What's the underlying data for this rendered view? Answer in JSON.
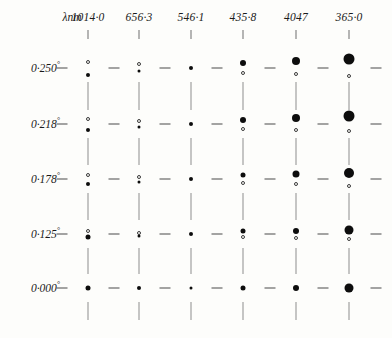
{
  "figure": {
    "axis_label": "λnm",
    "axis_label_x": 72,
    "axis_label_y": 18,
    "header_y": 18,
    "tick_y": 30,
    "tick_h": 9,
    "width": 392,
    "height": 338,
    "ink_color": "#0d0d0d",
    "grid_color": "#8d8d8d",
    "dash_color": "#4a4a4a",
    "paper_color": "#fdfdfb"
  },
  "chart_data": {
    "type": "scatter",
    "title": "",
    "subtitle": "",
    "xlabel": "λnm",
    "ylabel": "",
    "grid": true,
    "legend": "none",
    "x": [
      1014.0,
      656.3,
      546.1,
      435.8,
      404.7,
      365.0
    ],
    "x_tick_labels": [
      "1014·0",
      "656·3",
      "546·1",
      "435·8",
      "4047",
      "365·0"
    ],
    "x_pixels": [
      88,
      139,
      191,
      243,
      296,
      349
    ],
    "y_tick_labels": [
      "0·250",
      "0·218",
      "0·178",
      "0·125",
      "0·000"
    ],
    "y_unit": "°",
    "y": [
      0.25,
      0.218,
      0.178,
      0.125,
      0.0
    ],
    "y_pixels": [
      68,
      124,
      179,
      234,
      288
    ],
    "row_label_x": 60,
    "dash_positions_x": [
      62,
      114,
      165,
      217,
      270,
      323,
      376
    ],
    "dash_width": 11,
    "series": [
      {
        "name": "0·250°",
        "angle": 0.25,
        "row_index": 0,
        "points": [
          {
            "wavelength": 1014.0,
            "upper": {
              "style": "open",
              "size": 4,
              "offset": -6
            },
            "lower": {
              "style": "filled",
              "size": 4,
              "offset": 7
            }
          },
          {
            "wavelength": 656.3,
            "upper": {
              "style": "open",
              "size": 4,
              "offset": -4
            },
            "lower": {
              "style": "filled",
              "size": 3,
              "offset": 3
            }
          },
          {
            "wavelength": 546.1,
            "upper": {
              "style": "filled",
              "size": 4,
              "offset": 0
            },
            "lower": null
          },
          {
            "wavelength": 435.8,
            "upper": {
              "style": "filled",
              "size": 6,
              "offset": -5
            },
            "lower": {
              "style": "open",
              "size": 4,
              "offset": 5
            }
          },
          {
            "wavelength": 404.7,
            "upper": {
              "style": "filled",
              "size": 8,
              "offset": -7
            },
            "lower": {
              "style": "open",
              "size": 4,
              "offset": 6
            }
          },
          {
            "wavelength": 365.0,
            "upper": {
              "style": "filled",
              "size": 11,
              "offset": -9
            },
            "lower": {
              "style": "open",
              "size": 4,
              "offset": 8
            }
          }
        ]
      },
      {
        "name": "0·218°",
        "angle": 0.218,
        "row_index": 1,
        "points": [
          {
            "wavelength": 1014.0,
            "upper": {
              "style": "open",
              "size": 4,
              "offset": -5
            },
            "lower": {
              "style": "filled",
              "size": 4,
              "offset": 6
            }
          },
          {
            "wavelength": 656.3,
            "upper": {
              "style": "open",
              "size": 4,
              "offset": -3
            },
            "lower": {
              "style": "filled",
              "size": 3,
              "offset": 3
            }
          },
          {
            "wavelength": 546.1,
            "upper": {
              "style": "filled",
              "size": 4,
              "offset": 0
            },
            "lower": null
          },
          {
            "wavelength": 435.8,
            "upper": {
              "style": "filled",
              "size": 6,
              "offset": -4
            },
            "lower": {
              "style": "open",
              "size": 4,
              "offset": 5
            }
          },
          {
            "wavelength": 404.7,
            "upper": {
              "style": "filled",
              "size": 8,
              "offset": -6
            },
            "lower": {
              "style": "open",
              "size": 4,
              "offset": 6
            }
          },
          {
            "wavelength": 365.0,
            "upper": {
              "style": "filled",
              "size": 11,
              "offset": -8
            },
            "lower": {
              "style": "open",
              "size": 4,
              "offset": 7
            }
          }
        ]
      },
      {
        "name": "0·178°",
        "angle": 0.178,
        "row_index": 2,
        "points": [
          {
            "wavelength": 1014.0,
            "upper": {
              "style": "open",
              "size": 4,
              "offset": -4
            },
            "lower": {
              "style": "filled",
              "size": 4,
              "offset": 5
            }
          },
          {
            "wavelength": 656.3,
            "upper": {
              "style": "open",
              "size": 4,
              "offset": -2
            },
            "lower": {
              "style": "filled",
              "size": 3,
              "offset": 3
            }
          },
          {
            "wavelength": 546.1,
            "upper": {
              "style": "filled",
              "size": 4,
              "offset": 0
            },
            "lower": null
          },
          {
            "wavelength": 435.8,
            "upper": {
              "style": "filled",
              "size": 5,
              "offset": -4
            },
            "lower": {
              "style": "open",
              "size": 4,
              "offset": 4
            }
          },
          {
            "wavelength": 404.7,
            "upper": {
              "style": "filled",
              "size": 7,
              "offset": -5
            },
            "lower": {
              "style": "open",
              "size": 4,
              "offset": 5
            }
          },
          {
            "wavelength": 365.0,
            "upper": {
              "style": "filled",
              "size": 10,
              "offset": -6
            },
            "lower": {
              "style": "open",
              "size": 4,
              "offset": 7
            }
          }
        ]
      },
      {
        "name": "0·125°",
        "angle": 0.125,
        "row_index": 3,
        "points": [
          {
            "wavelength": 1014.0,
            "upper": {
              "style": "open",
              "size": 4,
              "offset": -3
            },
            "lower": {
              "style": "filled",
              "size": 5,
              "offset": 3
            }
          },
          {
            "wavelength": 656.3,
            "upper": {
              "style": "open",
              "size": 4,
              "offset": -1
            },
            "lower": {
              "style": "filled",
              "size": 3,
              "offset": 2
            }
          },
          {
            "wavelength": 546.1,
            "upper": {
              "style": "filled",
              "size": 4,
              "offset": 0
            },
            "lower": null
          },
          {
            "wavelength": 435.8,
            "upper": {
              "style": "filled",
              "size": 5,
              "offset": -3
            },
            "lower": {
              "style": "open",
              "size": 4,
              "offset": 3
            }
          },
          {
            "wavelength": 404.7,
            "upper": {
              "style": "filled",
              "size": 6,
              "offset": -3
            },
            "lower": {
              "style": "open",
              "size": 4,
              "offset": 4
            }
          },
          {
            "wavelength": 365.0,
            "upper": {
              "style": "filled",
              "size": 9,
              "offset": -4
            },
            "lower": {
              "style": "open",
              "size": 4,
              "offset": 5
            }
          }
        ]
      },
      {
        "name": "0·000°",
        "angle": 0.0,
        "row_index": 4,
        "points": [
          {
            "wavelength": 1014.0,
            "upper": {
              "style": "filled",
              "size": 5,
              "offset": 0
            },
            "lower": null
          },
          {
            "wavelength": 656.3,
            "upper": {
              "style": "filled",
              "size": 4,
              "offset": 0
            },
            "lower": null
          },
          {
            "wavelength": 546.1,
            "upper": {
              "style": "filled",
              "size": 3,
              "offset": 0
            },
            "lower": null
          },
          {
            "wavelength": 435.8,
            "upper": {
              "style": "filled",
              "size": 5,
              "offset": 0
            },
            "lower": null
          },
          {
            "wavelength": 404.7,
            "upper": {
              "style": "filled",
              "size": 6,
              "offset": 0
            },
            "lower": null
          },
          {
            "wavelength": 365.0,
            "upper": {
              "style": "filled",
              "size": 9,
              "offset": 0
            },
            "lower": null
          }
        ]
      }
    ]
  }
}
